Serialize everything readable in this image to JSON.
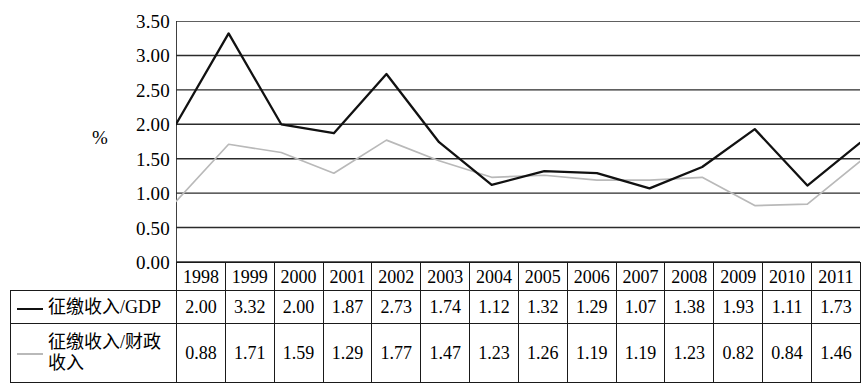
{
  "chart_data": {
    "type": "line",
    "title": "",
    "xlabel": "",
    "ylabel": "%",
    "ylim": [
      0.0,
      3.5
    ],
    "ytick_labels": [
      "3.50",
      "3.00",
      "2.50",
      "2.00",
      "1.50",
      "1.00",
      "0.50",
      "0.00"
    ],
    "yticks": [
      3.5,
      3.0,
      2.5,
      2.0,
      1.5,
      1.0,
      0.5,
      0.0
    ],
    "grid": true,
    "legend_position": "table-row-labels",
    "categories": [
      "1998",
      "1999",
      "2000",
      "2001",
      "2002",
      "2003",
      "2004",
      "2005",
      "2006",
      "2007",
      "2008",
      "2009",
      "2010",
      "2011"
    ],
    "series": [
      {
        "name": "征缴收入/GDP",
        "color": "#111111",
        "style": "solid",
        "values": [
          2.0,
          3.32,
          2.0,
          1.87,
          2.73,
          1.74,
          1.12,
          1.32,
          1.29,
          1.07,
          1.38,
          1.93,
          1.11,
          1.73
        ]
      },
      {
        "name": "征缴收入/财政收入",
        "color": "#b9b9b9",
        "style": "solid-light",
        "values": [
          0.88,
          1.71,
          1.59,
          1.29,
          1.77,
          1.47,
          1.23,
          1.26,
          1.19,
          1.19,
          1.23,
          0.82,
          0.84,
          1.46
        ]
      }
    ]
  },
  "axis": {
    "unit_label": "%",
    "ticks": [
      "3.50",
      "3.00",
      "2.50",
      "2.00",
      "1.50",
      "1.00",
      "0.50",
      "0.00"
    ]
  },
  "table": {
    "year_headers": [
      "1998",
      "1999",
      "2000",
      "2001",
      "2002",
      "2003",
      "2004",
      "2005",
      "2006",
      "2007",
      "2008",
      "2009",
      "2010",
      "2011"
    ],
    "rows": [
      {
        "label": "征缴收入/GDP",
        "label_line1": "征缴收入/GDP",
        "label_line2": "",
        "marker": "solid-black-line",
        "values": [
          "2.00",
          "3.32",
          "2.00",
          "1.87",
          "2.73",
          "1.74",
          "1.12",
          "1.32",
          "1.29",
          "1.07",
          "1.38",
          "1.93",
          "1.11",
          "1.73"
        ]
      },
      {
        "label": "征缴收入/财政收入",
        "label_line1": "征缴收入/财政",
        "label_line2": "收入",
        "marker": "solid-gray-line",
        "values": [
          "0.88",
          "1.71",
          "1.59",
          "1.29",
          "1.77",
          "1.47",
          "1.23",
          "1.26",
          "1.19",
          "1.19",
          "1.23",
          "0.82",
          "0.84",
          "1.46"
        ]
      }
    ]
  },
  "colors": {
    "series_1": "#111111",
    "series_2": "#b9b9b9",
    "grid": "#2b2b2b",
    "border": "#1a1a1a"
  }
}
